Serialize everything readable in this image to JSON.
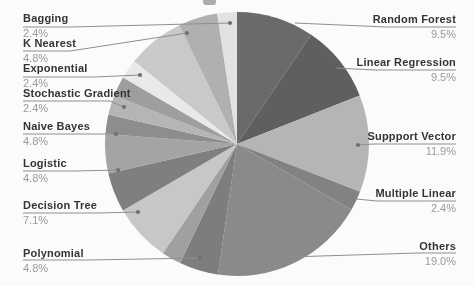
{
  "chart_data": {
    "type": "pie",
    "title": "",
    "unit": "%",
    "direction": "clockwise",
    "start_angle": "12-oclock",
    "legend_position": "callout-labels-around-pie",
    "background": "#fbfbf9",
    "line_color": "#8f8f8f",
    "dot_color": "#6f6f6f",
    "center": [
      237,
      144
    ],
    "radius": 132,
    "slices": [
      {
        "label": "Random Forest",
        "pct": "9.5%",
        "value": 9.5,
        "color": "#6a6a6a",
        "callout": {
          "side": "right",
          "label_top": 14,
          "pct_top": 29,
          "line": [
            [
              295,
              23
            ],
            [
              386,
              27
            ],
            [
              456,
              27
            ]
          ]
        }
      },
      {
        "label": "Linear Regression",
        "pct": "9.5%",
        "value": 9.5,
        "color": "#5f5f5f",
        "callout": {
          "side": "right",
          "label_top": 57,
          "pct_top": 72,
          "line": [
            [
              336,
              68
            ],
            [
              375,
              70
            ],
            [
              456,
              70
            ]
          ]
        }
      },
      {
        "label": "Suppport Vector",
        "pct": "11.9%",
        "value": 11.9,
        "color": "#b5b5b5",
        "callout": {
          "side": "right",
          "label_top": 131,
          "pct_top": 146,
          "line": [
            [
              358,
              145
            ],
            [
              374,
              144
            ],
            [
              456,
              144
            ]
          ],
          "dot": [
            358,
            145
          ]
        }
      },
      {
        "label": "Multiple Linear",
        "pct": "2.4%",
        "value": 2.4,
        "color": "#828282",
        "callout": {
          "side": "right",
          "label_top": 188,
          "pct_top": 203,
          "line": [
            [
              356,
              199
            ],
            [
              377,
              201
            ],
            [
              456,
              201
            ]
          ]
        }
      },
      {
        "label": "Others",
        "pct": "19.0%",
        "value": 19.0,
        "color": "#8a8a8a",
        "callout": {
          "side": "right",
          "label_top": 241,
          "pct_top": 256,
          "line": [
            [
              288,
              257
            ],
            [
              418,
              253
            ],
            [
              456,
              253
            ]
          ]
        }
      },
      {
        "label": "Polynomial",
        "pct": "4.8%",
        "value": 4.8,
        "color": "#7d7d7d",
        "callout": {
          "side": "left",
          "label_top": 248,
          "pct_top": 263,
          "line": [
            [
              200,
              258
            ],
            [
              88,
              260
            ],
            [
              23,
              260
            ]
          ],
          "dot": [
            200,
            258
          ]
        }
      },
      {
        "label": "",
        "pct": "",
        "value": 2.4,
        "color": "#a0a0a0"
      },
      {
        "label": "Decision Tree",
        "pct": "7.1%",
        "value": 7.1,
        "color": "#c7c7c7",
        "callout": {
          "side": "left",
          "label_top": 200,
          "pct_top": 215,
          "line": [
            [
              138,
              212
            ],
            [
              98,
              213
            ],
            [
              23,
              213
            ]
          ],
          "dot": [
            138,
            212
          ]
        }
      },
      {
        "label": "Logistic",
        "pct": "4.8%",
        "value": 4.8,
        "color": "#7f7f7f",
        "callout": {
          "side": "left",
          "label_top": 158,
          "pct_top": 173,
          "line": [
            [
              118,
              170
            ],
            [
              75,
              171
            ],
            [
              23,
              171
            ]
          ],
          "dot": [
            118,
            170
          ]
        }
      },
      {
        "label": "Naive Bayes",
        "pct": "4.8%",
        "value": 4.8,
        "color": "#a4a4a4",
        "callout": {
          "side": "left",
          "label_top": 121,
          "pct_top": 136,
          "line": [
            [
              116,
              134
            ],
            [
              88,
              134
            ],
            [
              23,
              134
            ]
          ],
          "dot": [
            116,
            134
          ]
        }
      },
      {
        "label": "Stochastic Gradient",
        "pct": "2.4%",
        "value": 2.4,
        "color": "#8d8d8d",
        "callout": {
          "side": "left",
          "label_top": 88,
          "pct_top": 103,
          "line": [
            [
              124,
              107
            ],
            [
              110,
              101
            ],
            [
              23,
              101
            ]
          ],
          "dot": [
            124,
            107
          ]
        }
      },
      {
        "label": "",
        "pct": "",
        "value": 2.4,
        "color": "#b5b5b5"
      },
      {
        "label": "Exponential",
        "pct": "2.4%",
        "value": 2.4,
        "color": "#9e9e9e",
        "callout": {
          "side": "left",
          "label_top": 63,
          "pct_top": 78,
          "line": [
            [
              140,
              75
            ],
            [
              95,
              77
            ],
            [
              23,
              77
            ]
          ],
          "dot": [
            140,
            75
          ]
        }
      },
      {
        "label": "",
        "pct": "",
        "value": 2.4,
        "color": "#e9e9e9"
      },
      {
        "label": "",
        "pct": "",
        "value": 7.0,
        "color": "#c9c9c9"
      },
      {
        "label": "K Nearest",
        "pct": "4.8%",
        "value": 4.8,
        "color": "#b0b0b0",
        "callout": {
          "side": "left",
          "label_top": 38,
          "pct_top": 53,
          "line": [
            [
              187,
              33
            ],
            [
              70,
              51
            ],
            [
              23,
              51
            ]
          ],
          "dot": [
            187,
            33
          ]
        }
      },
      {
        "label": "Bagging",
        "pct": "2.4%",
        "value": 2.4,
        "color": "#e2e2e2",
        "callout": {
          "side": "left",
          "label_top": 13,
          "pct_top": 28,
          "line": [
            [
              230,
              23
            ],
            [
              70,
              27
            ],
            [
              23,
              27
            ]
          ],
          "dot": [
            230,
            23
          ]
        }
      }
    ]
  }
}
